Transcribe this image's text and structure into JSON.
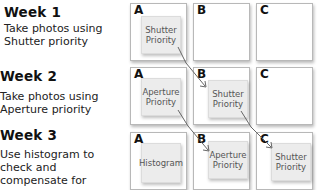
{
  "weeks": [
    {
      "title": "Week 1",
      "description": "Take photos using Shutter priority"
    },
    {
      "title": "Week 2",
      "description": "Take photos using Aperture priority"
    },
    {
      "title": "Week 3",
      "description": "Use histogram to check and compensate for exposure"
    }
  ],
  "columns": [
    "A",
    "B",
    "C"
  ],
  "grid": [
    {
      "A": {
        "line1": "Shutter",
        "line2": "Priority"
      },
      "B": null,
      "C": null
    },
    {
      "A": {
        "line1": "Aperture",
        "line2": "Priority"
      },
      "B": {
        "line1": "Shutter",
        "line2": "Priority"
      },
      "C": null
    },
    {
      "A": {
        "line1": "Histogram",
        "line2": ""
      },
      "B": {
        "line1": "Aperture",
        "line2": "Priority"
      },
      "C": {
        "line1": "Shutter",
        "line2": "Priority"
      }
    }
  ]
}
